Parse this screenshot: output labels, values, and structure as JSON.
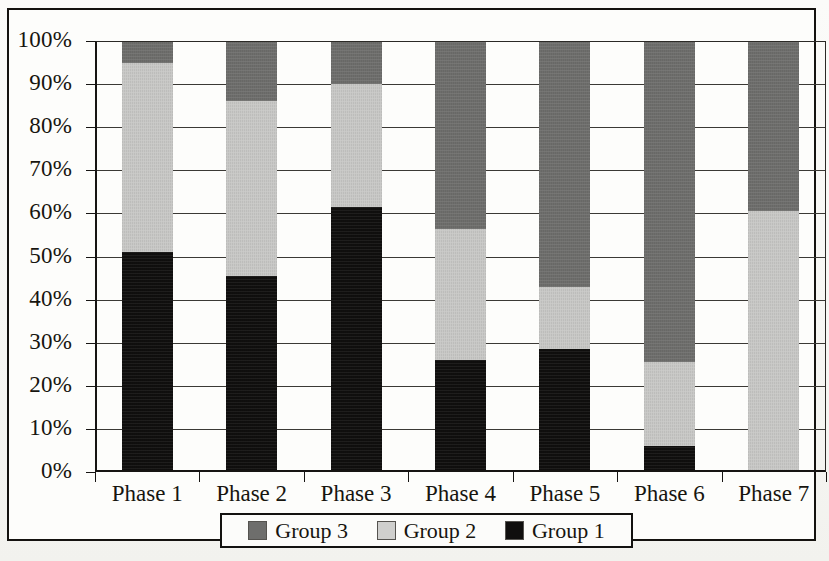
{
  "chart_data": {
    "type": "bar",
    "subtype": "stacked-percentage",
    "title": "",
    "xlabel": "",
    "ylabel": "",
    "ylim": [
      0,
      100
    ],
    "ytick_labels": [
      "0%",
      "10%",
      "20%",
      "30%",
      "40%",
      "50%",
      "60%",
      "70%",
      "80%",
      "90%",
      "100%"
    ],
    "ytick_values": [
      0,
      10,
      20,
      30,
      40,
      50,
      60,
      70,
      80,
      90,
      100
    ],
    "grid": true,
    "categories": [
      "Phase 1",
      "Phase 2",
      "Phase 3",
      "Phase 4",
      "Phase 5",
      "Phase 6",
      "Phase 7"
    ],
    "legend_position": "bottom",
    "legend_order": [
      "Group 3",
      "Group 2",
      "Group 1"
    ],
    "stack_order_bottom_to_top": [
      "Group 1",
      "Group 2",
      "Group 3"
    ],
    "series": [
      {
        "name": "Group 1",
        "color": "#100f0e",
        "values": [
          51,
          45.5,
          61.5,
          26,
          28.5,
          6,
          0
        ]
      },
      {
        "name": "Group 2",
        "color": "#c8c8c6",
        "values": [
          44,
          40.5,
          28.5,
          30.5,
          14.5,
          19.5,
          60.5
        ]
      },
      {
        "name": "Group 3",
        "color": "#6e6e6c",
        "values": [
          5,
          14,
          10,
          43.5,
          57,
          74.5,
          39.5
        ]
      }
    ],
    "cumulative_tops": {
      "Group 1": [
        51,
        45.5,
        61.5,
        26,
        28.5,
        6,
        0
      ],
      "Group 2": [
        95,
        86,
        90,
        56.5,
        43,
        25.5,
        60.5
      ],
      "Group 3": [
        100,
        100,
        100,
        100,
        100,
        100,
        100
      ]
    }
  },
  "legend": {
    "items": [
      {
        "label": "Group 3",
        "swatch": "dark-gray"
      },
      {
        "label": "Group 2",
        "swatch": "light-gray"
      },
      {
        "label": "Group 1",
        "swatch": "black"
      }
    ]
  },
  "colors": {
    "group1": "#100f0e",
    "group2": "#c8c8c6",
    "group3": "#6e6e6c",
    "axis": "#161412",
    "grid": "#3b3935",
    "background": "#fdfdfb"
  }
}
